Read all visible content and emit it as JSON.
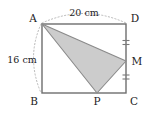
{
  "figure": {
    "colors": {
      "outline": "#6e6e6e",
      "triangle_fill": "#cccccc",
      "triangle_stroke": "#8a8a8a",
      "arc_dots": "#b5b5b5",
      "tick": "#7a7a7a",
      "label_text": "#1c1c1c",
      "background": "#ffffff"
    },
    "vertices": [
      {
        "name": "A",
        "label": "A",
        "x": 42,
        "y": 24,
        "label_x": 33,
        "label_y": 22
      },
      {
        "name": "D",
        "label": "D",
        "x": 126,
        "y": 24,
        "label_x": 131,
        "label_y": 22
      },
      {
        "name": "B",
        "label": "B",
        "x": 42,
        "y": 93,
        "label_x": 32,
        "label_y": 104
      },
      {
        "name": "C",
        "label": "C",
        "x": 126,
        "y": 93,
        "label_x": 131,
        "label_y": 104
      },
      {
        "name": "M",
        "label": "M",
        "x": 126,
        "y": 61,
        "label_x": 132,
        "label_y": 64
      },
      {
        "name": "P",
        "label": "P",
        "x": 97,
        "y": 93,
        "label_x": 94,
        "label_y": 104
      }
    ],
    "dimensions": [
      {
        "name": "top-width",
        "label": "20 cm",
        "label_x": 84,
        "label_y": 15,
        "side": "AD"
      },
      {
        "name": "left-height",
        "label": "16 cm",
        "label_x": 19,
        "label_y": 61,
        "side": "AB"
      }
    ],
    "shaded_region": {
      "name": "triangle-AMP",
      "points": "42,24 126,61 97,93"
    },
    "rectangle": {
      "x": 42,
      "y": 24,
      "width": 84,
      "height": 69
    },
    "segments": [
      {
        "name": "segment-AM",
        "x1": 42,
        "y1": 24,
        "x2": 126,
        "y2": 61
      },
      {
        "name": "segment-AP",
        "x1": 42,
        "y1": 24,
        "x2": 97,
        "y2": 93
      },
      {
        "name": "segment-MP",
        "x1": 126,
        "y1": 61,
        "x2": 97,
        "y2": 93
      }
    ],
    "tick_marks": [
      {
        "name": "tick-DM",
        "x": 126,
        "y": 42.5
      },
      {
        "name": "tick-MC",
        "x": 126,
        "y": 77
      }
    ],
    "arcs": [
      {
        "name": "arc-top-AD",
        "d": "M 42 23 Q 84 4 126 23"
      },
      {
        "name": "arc-left-AB",
        "d": "M 41 24 Q 26 58 41 93"
      }
    ]
  }
}
